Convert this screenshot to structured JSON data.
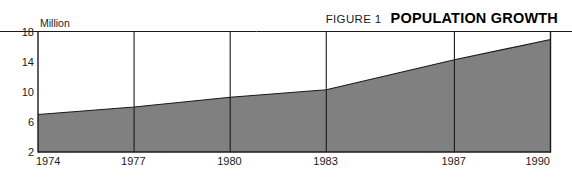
{
  "header": {
    "figure_label": "FIGURE 1",
    "title": "POPULATION GROWTH"
  },
  "chart_data": {
    "type": "area",
    "title": "POPULATION GROWTH",
    "subtitle": "FIGURE 1",
    "xlabel": "",
    "ylabel": "Million",
    "unit_caption": "Million",
    "x": [
      1974,
      1977,
      1980,
      1983,
      1987,
      1990
    ],
    "categories": [
      "1974",
      "1977",
      "1980",
      "1983",
      "1987",
      "1990"
    ],
    "values": [
      7.0,
      8.0,
      9.3,
      10.3,
      14.3,
      17.0
    ],
    "series": [
      {
        "name": "Population",
        "values": [
          7.0,
          8.0,
          9.3,
          10.3,
          14.3,
          17.0
        ]
      }
    ],
    "ylim": [
      2,
      18
    ],
    "xlim": [
      1974,
      1990
    ],
    "yticks": [
      18,
      14,
      10,
      6,
      2
    ],
    "ytick_labels": [
      "18",
      "14",
      "10",
      "6",
      "2"
    ],
    "xticks": [
      1974,
      1977,
      1980,
      1983,
      1987,
      1990
    ],
    "xtick_labels": [
      "1974",
      "1977",
      "1980",
      "1983",
      "1987",
      "1990"
    ],
    "grid": "vertical-only",
    "legend": "none",
    "fill_color": "#808080",
    "line_color": "#1a1a1a",
    "axis_color": "#1a1a1a",
    "background_color": "#ffffff"
  }
}
